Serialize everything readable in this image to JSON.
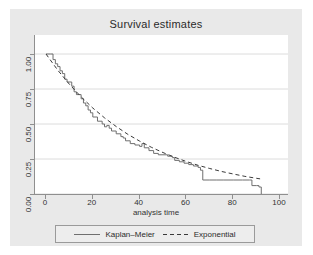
{
  "chart_data": {
    "type": "line",
    "title": "Survival estimates",
    "xlabel": "analysis time",
    "ylabel": "",
    "xlim": [
      0,
      100
    ],
    "ylim": [
      0,
      1.0
    ],
    "grid": true,
    "grid_axis": "y",
    "legend_position": "bottom",
    "xticks": [
      "0",
      "20",
      "40",
      "60",
      "80",
      "100"
    ],
    "xtick_values": [
      0,
      20,
      40,
      60,
      80,
      100
    ],
    "yticks": [
      "0.00",
      "0.25",
      "0.50",
      "0.75",
      "1.00"
    ],
    "ytick_values": [
      0.0,
      0.25,
      0.5,
      0.75,
      1.0
    ],
    "series": [
      {
        "name": "Kaplan-Meier",
        "style": "solid-step",
        "color": "#6f6f6f",
        "x": [
          0,
          2,
          3,
          4,
          5,
          6,
          7,
          8,
          9,
          11,
          12,
          13,
          15,
          16,
          17,
          18,
          19,
          20,
          22,
          24,
          25,
          26,
          27,
          28,
          30,
          32,
          33,
          34,
          36,
          38,
          40,
          41,
          42,
          44,
          46,
          48,
          50,
          52,
          54,
          55,
          57,
          59,
          61,
          63,
          65,
          66,
          67,
          70,
          73,
          76,
          80,
          84,
          87,
          88,
          90,
          91,
          92
        ],
        "y": [
          1.0,
          1.0,
          0.96,
          0.93,
          0.91,
          0.88,
          0.86,
          0.82,
          0.8,
          0.77,
          0.73,
          0.71,
          0.68,
          0.65,
          0.63,
          0.6,
          0.58,
          0.55,
          0.52,
          0.5,
          0.48,
          0.49,
          0.47,
          0.45,
          0.43,
          0.41,
          0.4,
          0.38,
          0.36,
          0.35,
          0.34,
          0.36,
          0.33,
          0.31,
          0.29,
          0.28,
          0.28,
          0.27,
          0.26,
          0.24,
          0.23,
          0.22,
          0.21,
          0.2,
          0.19,
          0.17,
          0.1,
          0.1,
          0.1,
          0.1,
          0.1,
          0.1,
          0.1,
          0.06,
          0.06,
          0.05,
          0.0
        ]
      },
      {
        "name": "Exponential",
        "style": "dashed",
        "color": "#3a3a3a",
        "x": [
          0,
          5,
          10,
          15,
          20,
          25,
          30,
          35,
          40,
          45,
          50,
          55,
          60,
          65,
          70,
          75,
          80,
          85,
          90,
          92
        ],
        "y": [
          1.0,
          0.885,
          0.784,
          0.694,
          0.614,
          0.544,
          0.482,
          0.426,
          0.378,
          0.334,
          0.296,
          0.262,
          0.232,
          0.205,
          0.182,
          0.161,
          0.143,
          0.126,
          0.112,
          0.107
        ]
      }
    ]
  },
  "legend": {
    "entries": [
      {
        "label": "Kaplan–Meier",
        "style": "solid"
      },
      {
        "label": "Exponential",
        "style": "dashed"
      }
    ]
  }
}
